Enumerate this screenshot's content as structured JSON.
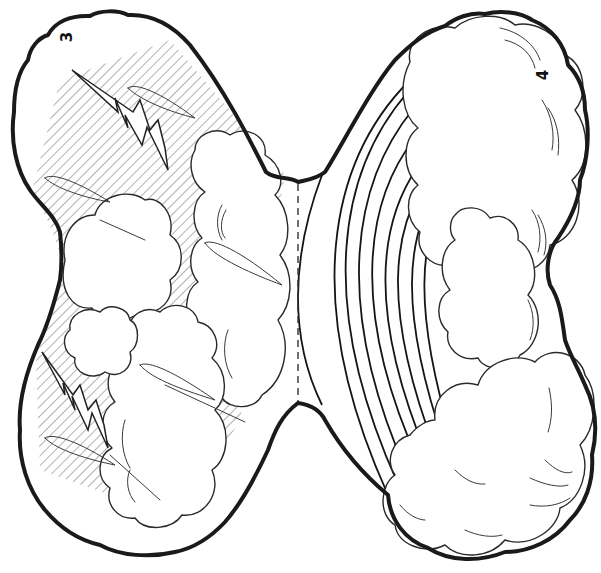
{
  "page": {
    "colors": {
      "ink": "#1a1a1a",
      "paper": "#ffffff",
      "hatch": "#555555"
    }
  },
  "top_cropped_text": "· · ·",
  "panels": [
    {
      "id": "left",
      "number": "3",
      "theme": "storm clouds with lightning and rain hatching",
      "icon": "lightning-bolt-icon"
    },
    {
      "id": "right",
      "number": "4",
      "theme": "rainbow arcs emerging from clouds",
      "icon": "rainbow-icon"
    }
  ],
  "fold_line": {
    "style": "dashed",
    "x": 298,
    "y_start": 182,
    "y_end": 403
  },
  "rainbow": {
    "band_count": 9
  }
}
